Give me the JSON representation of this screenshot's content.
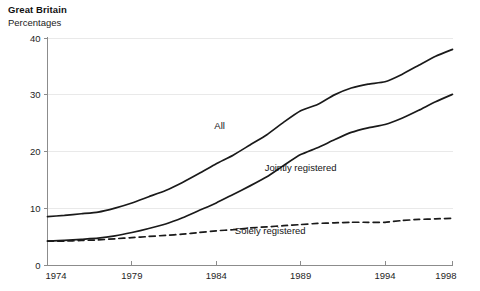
{
  "header": {
    "title": "Great Britain",
    "subtitle": "Percentages"
  },
  "chart_data": {
    "type": "line",
    "title": "Great Britain",
    "subtitle": "Percentages",
    "xlabel": "",
    "ylabel": "Percentages",
    "xlim": [
      1974,
      1998
    ],
    "ylim": [
      0,
      40
    ],
    "grid": "horizontal",
    "legend_position": "inline-labels",
    "x_ticks": [
      1974,
      1979,
      1984,
      1989,
      1994,
      1998
    ],
    "x_tick_labels": [
      "1974",
      "1979",
      "1984",
      "1989",
      "1994",
      "1998"
    ],
    "y_ticks": [
      0,
      10,
      20,
      30,
      40
    ],
    "y_tick_labels": [
      "0",
      "10",
      "20",
      "30",
      "40"
    ],
    "x": [
      1974,
      1975,
      1976,
      1977,
      1978,
      1979,
      1980,
      1981,
      1982,
      1983,
      1984,
      1985,
      1986,
      1987,
      1988,
      1989,
      1990,
      1991,
      1992,
      1993,
      1994,
      1995,
      1996,
      1997,
      1998
    ],
    "series": [
      {
        "name": "All",
        "label": "All",
        "style": "solid",
        "color": "#1a1a1a",
        "label_x": 1984.2,
        "label_y": 24.0,
        "values": [
          8.6,
          8.8,
          9.1,
          9.4,
          10.1,
          11.0,
          12.1,
          13.2,
          14.6,
          16.2,
          17.9,
          19.4,
          21.2,
          23.0,
          25.2,
          27.2,
          28.3,
          30.0,
          31.2,
          31.9,
          32.3,
          33.6,
          35.2,
          36.8,
          38.0
        ],
        "unit": "%"
      },
      {
        "name": "Jointly registered",
        "label": "Jointly registered",
        "style": "solid",
        "color": "#1a1a1a",
        "label_x": 1989.0,
        "label_y": 16.6,
        "values": [
          4.3,
          4.4,
          4.6,
          4.8,
          5.2,
          5.8,
          6.5,
          7.3,
          8.4,
          9.7,
          11.0,
          12.5,
          14.0,
          15.6,
          17.6,
          19.5,
          20.7,
          22.1,
          23.4,
          24.2,
          24.8,
          25.9,
          27.3,
          28.8,
          30.1
        ],
        "unit": "%"
      },
      {
        "name": "Solely registered",
        "label": "Solely registered",
        "style": "dashed",
        "color": "#1a1a1a",
        "label_x": 1987.2,
        "label_y": 5.6,
        "values": [
          4.3,
          4.3,
          4.4,
          4.5,
          4.7,
          4.9,
          5.1,
          5.3,
          5.5,
          5.8,
          6.1,
          6.3,
          6.6,
          6.8,
          7.0,
          7.2,
          7.4,
          7.5,
          7.6,
          7.6,
          7.6,
          7.9,
          8.1,
          8.2,
          8.3
        ],
        "unit": "%"
      }
    ]
  }
}
